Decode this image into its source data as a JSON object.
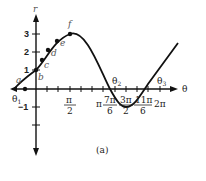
{
  "figure": {
    "caption": "(a)",
    "function": "r = 1 + 2 sin θ",
    "axes": {
      "x_label": "θ",
      "y_label": "r",
      "y_ticks": [
        "3",
        "2",
        "1",
        "−1"
      ],
      "x_ticks": [
        {
          "num": "π",
          "den": "2"
        },
        {
          "num": "π",
          "den": ""
        },
        {
          "num": "7π",
          "den": "6"
        },
        {
          "num": "3π",
          "den": "2"
        },
        {
          "num": "11π",
          "den": "6"
        },
        {
          "num": "2π",
          "den": ""
        }
      ]
    },
    "points": [
      {
        "label": "a"
      },
      {
        "label": "b"
      },
      {
        "label": "c"
      },
      {
        "label": "d"
      },
      {
        "label": "e"
      },
      {
        "label": "f"
      }
    ],
    "angles": [
      "θ1",
      "θ2",
      "θ3"
    ],
    "angle_base": "θ",
    "angle_subs": [
      "1",
      "2",
      "3"
    ]
  }
}
